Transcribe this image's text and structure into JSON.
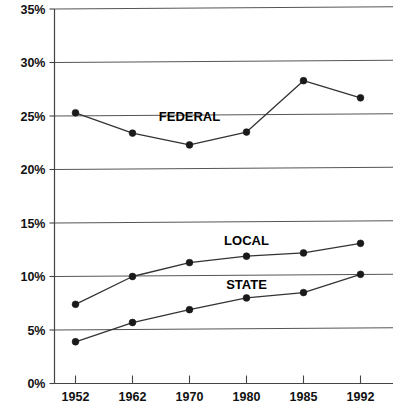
{
  "chart_data": {
    "type": "line",
    "title": "",
    "xlabel": "",
    "ylabel": "",
    "categories": [
      "1952",
      "1962",
      "1970",
      "1980",
      "1985",
      "1992"
    ],
    "ylim": [
      0,
      35
    ],
    "ytick_labels": [
      "0%",
      "5%",
      "10%",
      "15%",
      "20%",
      "25%",
      "30%",
      "35%"
    ],
    "ytick_values": [
      0,
      5,
      10,
      15,
      20,
      25,
      30,
      35
    ],
    "grid": true,
    "legend_position": "inline-annotations",
    "series": [
      {
        "name": "FEDERAL",
        "values": [
          25.3,
          23.4,
          22.3,
          23.5,
          28.3,
          26.7
        ],
        "label_text": "FEDERAL",
        "label_x_category_fraction": 2.0,
        "label_y_value": 24.5
      },
      {
        "name": "LOCAL",
        "values": [
          7.4,
          10.0,
          11.3,
          11.9,
          12.2,
          13.1
        ],
        "label_text": "LOCAL",
        "label_x_category_fraction": 3.0,
        "label_y_value": 12.9
      },
      {
        "name": "STATE",
        "values": [
          3.9,
          5.7,
          6.9,
          8.0,
          8.5,
          10.2
        ],
        "label_text": "STATE",
        "label_x_category_fraction": 3.0,
        "label_y_value": 8.8
      }
    ],
    "colors": {
      "line": "#333333",
      "marker": "#1a1a1a",
      "grid": "#555555",
      "axis": "#444444",
      "text": "#111111",
      "background": "#ffffff"
    }
  }
}
